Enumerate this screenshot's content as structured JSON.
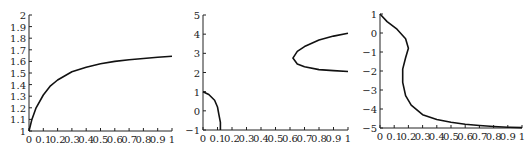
{
  "chart_data": [
    {
      "type": "line",
      "title": "",
      "xlabel": "",
      "ylabel": "",
      "xlim": [
        0,
        1
      ],
      "ylim": [
        1,
        2
      ],
      "x_ticks": [
        "0",
        "0.1",
        "0.2",
        "0.3",
        "0.4",
        "0.5",
        "0.6",
        "0.7",
        "0.8",
        "0.9",
        "1"
      ],
      "y_ticks": [
        "1",
        "1.1",
        "1.2",
        "1.3",
        "1.4",
        "1.5",
        "1.6",
        "1.7",
        "1.8",
        "1.9",
        "2"
      ],
      "grid": false,
      "series": [
        {
          "name": "curve",
          "x": [
            0,
            0.02,
            0.05,
            0.1,
            0.15,
            0.2,
            0.3,
            0.4,
            0.5,
            0.6,
            0.7,
            0.8,
            0.9,
            1.0
          ],
          "y": [
            1.0,
            1.1,
            1.2,
            1.31,
            1.39,
            1.44,
            1.51,
            1.55,
            1.58,
            1.6,
            1.615,
            1.625,
            1.635,
            1.645
          ]
        }
      ]
    },
    {
      "type": "line",
      "title": "",
      "xlabel": "",
      "ylabel": "",
      "xlim": [
        0,
        1
      ],
      "ylim": [
        -1,
        5
      ],
      "x_ticks": [
        "0",
        "0.1",
        "0.2",
        "0.3",
        "0.4",
        "0.5",
        "0.6",
        "0.7",
        "0.8",
        "0.9",
        "1"
      ],
      "y_ticks": [
        "-1",
        "0",
        "1",
        "2",
        "3",
        "4",
        "5"
      ],
      "grid": false,
      "series": [
        {
          "name": "branch-low",
          "x": [
            0,
            0.04,
            0.08,
            0.1,
            0.11,
            0.12,
            0.12
          ],
          "y": [
            1.0,
            0.85,
            0.55,
            0.2,
            -0.2,
            -0.6,
            -1.0
          ]
        },
        {
          "name": "branch-upper",
          "x": [
            1.0,
            0.9,
            0.8,
            0.7,
            0.65,
            0.62,
            0.65,
            0.7,
            0.8,
            0.9,
            1.0
          ],
          "y": [
            4.05,
            3.9,
            3.7,
            3.35,
            3.1,
            2.75,
            2.45,
            2.3,
            2.15,
            2.1,
            2.05
          ]
        }
      ]
    },
    {
      "type": "line",
      "title": "",
      "xlabel": "",
      "ylabel": "",
      "xlim": [
        0,
        1
      ],
      "ylim": [
        -5,
        1
      ],
      "x_ticks": [
        "0",
        "0.1",
        "0.2",
        "0.3",
        "0.4",
        "0.5",
        "0.6",
        "0.7",
        "0.8",
        "0.9",
        "1"
      ],
      "y_ticks": [
        "-5",
        "-4",
        "-3",
        "-2",
        "-1",
        "0",
        "1"
      ],
      "grid": false,
      "series": [
        {
          "name": "curve",
          "x": [
            0,
            0.05,
            0.12,
            0.18,
            0.2,
            0.18,
            0.16,
            0.16,
            0.18,
            0.22,
            0.3,
            0.4,
            0.5,
            0.6,
            0.7,
            0.8,
            0.9,
            1.0
          ],
          "y": [
            1.0,
            0.6,
            0.2,
            -0.3,
            -0.8,
            -1.3,
            -1.9,
            -2.6,
            -3.3,
            -3.8,
            -4.3,
            -4.55,
            -4.7,
            -4.8,
            -4.87,
            -4.92,
            -4.96,
            -4.98
          ]
        }
      ]
    }
  ]
}
